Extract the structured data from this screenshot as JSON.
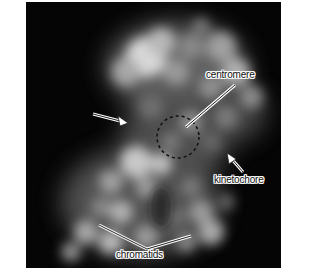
{
  "figure": {
    "background_color": "#050505",
    "labels": {
      "centromere": "centromere",
      "kinetochore": "kinetochore",
      "chromatids": "chromatids"
    },
    "annotations": [
      {
        "type": "arrow",
        "target": "chromosome arm (unlabeled)"
      },
      {
        "type": "dashed-circle",
        "target": "centromere"
      },
      {
        "type": "arrow",
        "target": "kinetochore"
      },
      {
        "type": "pointer-lines",
        "target": "chromatids"
      }
    ]
  }
}
